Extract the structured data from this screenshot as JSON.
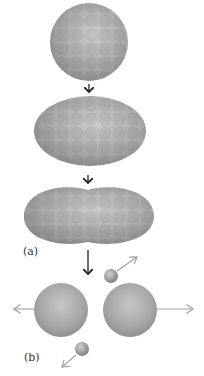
{
  "diagram": {
    "labels": {
      "a": "(a)",
      "b": "(b)"
    },
    "stages": [
      {
        "name": "spherical-nucleus"
      },
      {
        "name": "elongated-nucleus"
      },
      {
        "name": "necking-nucleus"
      },
      {
        "name": "fission-fragments"
      }
    ],
    "colors": {
      "nucleus_base": "#a9a9a9",
      "nucleus_light": "#cfcfcf",
      "nucleus_dark": "#8c8c8c",
      "nucleon_tint": "#9a9a9a",
      "arrow_dark": "#222222",
      "arrow_light": "#a0a0a0",
      "neutron": "#9a9a9a"
    }
  }
}
